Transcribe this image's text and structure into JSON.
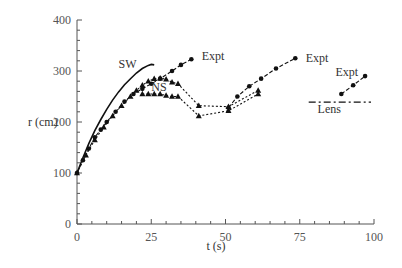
{
  "chart_data": {
    "type": "line",
    "title": "",
    "xlabel": "t (s)",
    "ylabel": "r (cm)",
    "xlim": [
      0,
      100
    ],
    "ylim": [
      0,
      400
    ],
    "xticks": [
      0,
      25,
      50,
      75,
      100
    ],
    "yticks": [
      0,
      100,
      200,
      300,
      400
    ],
    "grid": false,
    "legend": "inline annotations",
    "series": [
      {
        "name": "SW",
        "style": "solid",
        "marker": "none",
        "x": [
          0,
          2,
          4,
          6,
          8,
          10,
          12,
          14,
          16,
          18,
          20,
          22,
          24,
          25,
          26
        ],
        "y": [
          100,
          130,
          158,
          183,
          205,
          225,
          243,
          259,
          273,
          285,
          296,
          305,
          311,
          313,
          312
        ]
      },
      {
        "name": "Expt (segment 1)",
        "style": "dashed",
        "marker": "circle",
        "x": [
          0,
          2,
          4,
          6,
          8,
          10,
          13,
          16,
          19,
          22,
          25,
          28,
          32,
          35,
          38.5
        ],
        "y": [
          100,
          125,
          148,
          170,
          185,
          200,
          220,
          240,
          255,
          265,
          275,
          285,
          300,
          312,
          323
        ]
      },
      {
        "name": "NS (upper)",
        "style": "dotted",
        "marker": "triangle",
        "x": [
          0,
          3,
          6,
          9,
          12,
          15,
          18,
          20,
          22,
          24,
          26,
          28,
          30,
          32,
          34,
          41,
          51,
          61
        ],
        "y": [
          100,
          135,
          165,
          190,
          212,
          232,
          250,
          262,
          272,
          280,
          285,
          286,
          284,
          278,
          275,
          232,
          230,
          262
        ]
      },
      {
        "name": "NS (lower)",
        "style": "dotted",
        "marker": "triangle",
        "x": [
          22,
          24,
          26,
          28,
          30,
          32,
          34,
          41,
          51,
          61
        ],
        "y": [
          255,
          255,
          255,
          255,
          252,
          250,
          250,
          212,
          222,
          255
        ]
      },
      {
        "name": "Expt (segment 2)",
        "style": "dashed",
        "marker": "circle",
        "x": [
          51,
          54,
          58,
          62,
          67,
          73.5
        ],
        "y": [
          228,
          250,
          270,
          285,
          305,
          325
        ]
      },
      {
        "name": "Expt (segment 3)",
        "style": "dashed",
        "marker": "circle",
        "x": [
          89,
          93,
          97
        ],
        "y": [
          255,
          272,
          290
        ]
      },
      {
        "name": "Lens",
        "style": "dashdot",
        "marker": "none",
        "x": [
          78,
          99
        ],
        "y": [
          239,
          239
        ]
      }
    ],
    "annotations": [
      {
        "text": "SW",
        "x": 14,
        "y": 305
      },
      {
        "text": "NS",
        "x": 25,
        "y": 260
      },
      {
        "text": "Expt",
        "x": 42,
        "y": 322
      },
      {
        "text": "Expt",
        "x": 77,
        "y": 318
      },
      {
        "text": "Expt",
        "x": 87,
        "y": 290
      },
      {
        "text": "Lens",
        "x": 81,
        "y": 218
      }
    ]
  }
}
